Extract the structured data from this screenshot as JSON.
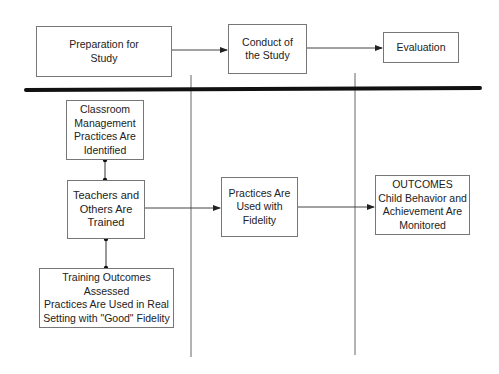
{
  "diagram": {
    "phases": [
      {
        "id": "preparation",
        "label": "Preparation for\nStudy"
      },
      {
        "id": "conduct",
        "label": "Conduct of\nthe Study"
      },
      {
        "id": "evaluation",
        "label": "Evaluation"
      }
    ],
    "steps": [
      {
        "id": "identified",
        "label": "Classroom\nManagement\nPractices Are\nIdentified"
      },
      {
        "id": "trained",
        "label": "Teachers and\nOthers Are\nTrained"
      },
      {
        "id": "assessed",
        "label": "Training Outcomes\nAssessed\nPractices Are Used in Real\nSetting with \"Good\" Fidelity"
      },
      {
        "id": "fidelity",
        "label": "Practices Are\nUsed with\nFidelity"
      },
      {
        "id": "outcomes",
        "label": "OUTCOMES\nChild Behavior and\nAchievement Are\nMonitored"
      }
    ],
    "connections": [
      {
        "from": "preparation",
        "to": "conduct",
        "type": "arrow"
      },
      {
        "from": "conduct",
        "to": "evaluation",
        "type": "arrow"
      },
      {
        "from": "identified",
        "to": "trained",
        "type": "dot-line"
      },
      {
        "from": "trained",
        "to": "assessed",
        "type": "dot-line"
      },
      {
        "from": "trained",
        "to": "fidelity",
        "type": "arrow"
      },
      {
        "from": "fidelity",
        "to": "outcomes",
        "type": "arrow"
      }
    ],
    "colors": {
      "line": "#333333",
      "divider": "#111111",
      "box_border": "#777777"
    }
  }
}
